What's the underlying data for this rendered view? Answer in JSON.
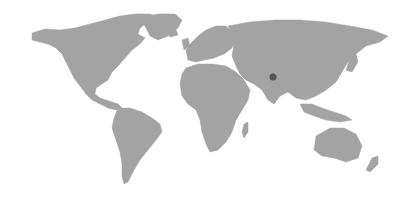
{
  "map": {
    "type": "world-map",
    "land_color": "#a3a3a3",
    "background_color": "#ffffff",
    "marker": {
      "icon": "location-dot-icon",
      "color": "#555555",
      "x": 273,
      "y": 77
    }
  }
}
